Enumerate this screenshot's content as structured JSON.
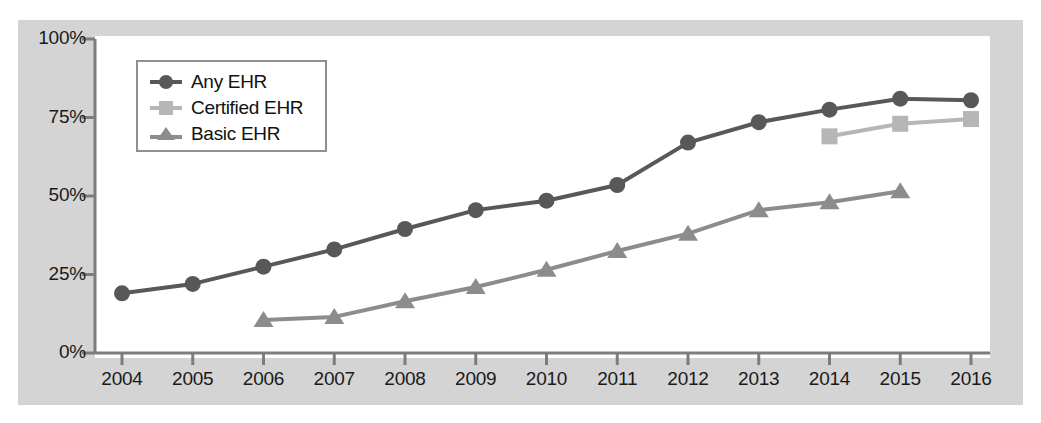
{
  "chart_data": {
    "type": "line",
    "title": "",
    "xlabel": "",
    "ylabel": "",
    "x": [
      2004,
      2005,
      2006,
      2007,
      2008,
      2009,
      2010,
      2011,
      2012,
      2013,
      2014,
      2015,
      2016
    ],
    "categories": [
      "2004",
      "2005",
      "2006",
      "2007",
      "2008",
      "2009",
      "2010",
      "2011",
      "2012",
      "2013",
      "2014",
      "2015",
      "2016"
    ],
    "xlim": [
      2004,
      2016
    ],
    "ylim": [
      0,
      100
    ],
    "yticks": [
      0,
      25,
      50,
      75,
      100
    ],
    "ytick_labels": [
      "0%",
      "25%",
      "50%",
      "75%",
      "100%"
    ],
    "xtick_labels": [
      "2004",
      "2005",
      "2006",
      "2007",
      "2008",
      "2009",
      "2010",
      "2011",
      "2012",
      "2013",
      "2014",
      "2015",
      "2016"
    ],
    "grid": false,
    "legend_position": "upper-left-inside",
    "series": [
      {
        "name": "Any EHR",
        "marker": "circle",
        "color": "#585858",
        "x": [
          2004,
          2005,
          2006,
          2007,
          2008,
          2009,
          2010,
          2011,
          2012,
          2013,
          2014,
          2015,
          2016
        ],
        "values": [
          19,
          22,
          27.5,
          33,
          39.5,
          45.5,
          48.5,
          53.5,
          67,
          73.5,
          77.5,
          81,
          80.5
        ]
      },
      {
        "name": "Certified EHR",
        "marker": "square",
        "color": "#b6b6b6",
        "x": [
          2014,
          2015,
          2016
        ],
        "values": [
          69,
          73,
          74.5
        ]
      },
      {
        "name": "Basic EHR",
        "marker": "triangle",
        "color": "#8c8c8c",
        "x": [
          2006,
          2007,
          2008,
          2009,
          2010,
          2011,
          2012,
          2013,
          2014,
          2015
        ],
        "values": [
          10.5,
          11.5,
          16.5,
          21,
          26.5,
          32.5,
          38,
          45.5,
          48,
          51.5
        ]
      }
    ]
  },
  "legend": {
    "entries": [
      {
        "label": "Any EHR",
        "color": "#585858",
        "marker": "circle-marker"
      },
      {
        "label": "Certified EHR",
        "color": "#b6b6b6",
        "marker": "square-marker"
      },
      {
        "label": "Basic EHR",
        "color": "#8c8c8c",
        "marker": "triangle-marker"
      }
    ]
  },
  "colors": {
    "panel_background": "#d4d4d4",
    "plot_background": "#ffffff",
    "axis": "#7d7d7d",
    "text": "#1a1a1a"
  }
}
